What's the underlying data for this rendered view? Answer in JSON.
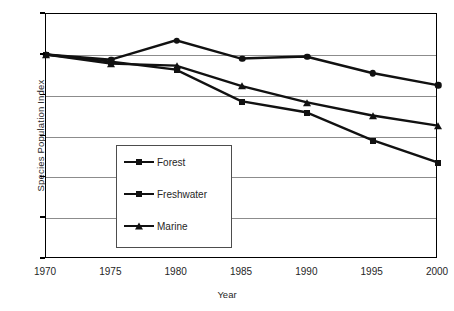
{
  "chart_data": {
    "type": "line",
    "title": "",
    "xlabel": "Year",
    "ylabel": "Species Population Index",
    "categories": [
      1970,
      1975,
      1980,
      1985,
      1990,
      1995,
      2000
    ],
    "x_tick_labels": [
      "1970",
      "1975",
      "1980",
      "1985",
      "1990",
      "1995",
      "2000"
    ],
    "y_tick_labels": [
      "1.2",
      "1",
      "0.8",
      "0.6",
      "0.4",
      "0.2",
      "0"
    ],
    "y_tick_values": [
      1.2,
      1,
      0.8,
      0.6,
      0.4,
      0.2,
      0
    ],
    "xlim": [
      1970,
      2000
    ],
    "ylim": [
      0,
      1.2
    ],
    "grid": "horizontal",
    "legend_position": "inside-lower-left",
    "series": [
      {
        "name": "Forest",
        "marker": "square",
        "color": "#111111",
        "values": [
          1.0,
          0.965,
          0.925,
          0.77,
          0.715,
          0.58,
          0.47
        ]
      },
      {
        "name": "Freshwater",
        "marker": "circle",
        "color": "#111111",
        "values": [
          1.0,
          0.975,
          1.07,
          0.98,
          0.99,
          0.91,
          0.85
        ]
      },
      {
        "name": "Marine",
        "marker": "triangle",
        "color": "#111111",
        "values": [
          1.0,
          0.955,
          0.945,
          0.845,
          0.765,
          0.7,
          0.65
        ]
      }
    ]
  },
  "axis": {
    "y_title": "Species Population Index",
    "x_title": "Year"
  }
}
